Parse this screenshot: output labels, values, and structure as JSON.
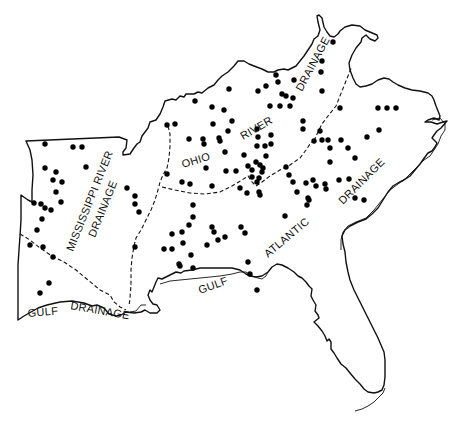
{
  "map": {
    "colors": {
      "background": "#ffffff",
      "ink": "#111111",
      "dot": "#000000"
    },
    "regions": {
      "ohio_river_drainage": {
        "labels": [
          "OHIO",
          "RIVER",
          "DRAINAGE"
        ]
      },
      "mississippi_river_drainage": {
        "labels": [
          "MISSISSIPPI RIVER",
          "DRAINAGE"
        ]
      },
      "gulf_drainage_west": {
        "labels": [
          "GULF",
          "DRAINAGE"
        ]
      },
      "gulf_atlantic": {
        "labels": [
          "GULF",
          "ATLANTIC"
        ]
      },
      "atlantic_drainage": {
        "labels": [
          "DRAINAGE"
        ]
      }
    },
    "dots": [
      [
        45,
        144
      ],
      [
        73,
        147
      ],
      [
        82,
        147
      ],
      [
        86,
        167
      ],
      [
        45,
        168
      ],
      [
        56,
        172
      ],
      [
        53,
        180
      ],
      [
        62,
        182
      ],
      [
        56,
        192
      ],
      [
        61,
        202
      ],
      [
        34,
        203
      ],
      [
        41,
        204
      ],
      [
        45,
        208
      ],
      [
        51,
        210
      ],
      [
        42,
        219
      ],
      [
        37,
        230
      ],
      [
        30,
        245
      ],
      [
        43,
        247
      ],
      [
        53,
        257
      ],
      [
        49,
        283
      ],
      [
        40,
        293
      ],
      [
        127,
        188
      ],
      [
        135,
        196
      ],
      [
        135,
        204
      ],
      [
        139,
        212
      ],
      [
        135,
        247
      ],
      [
        167,
        125
      ],
      [
        175,
        124
      ],
      [
        167,
        174
      ],
      [
        182,
        182
      ],
      [
        190,
        184
      ],
      [
        212,
        186
      ],
      [
        195,
        101
      ],
      [
        212,
        107
      ],
      [
        224,
        110
      ],
      [
        229,
        89
      ],
      [
        213,
        124
      ],
      [
        232,
        121
      ],
      [
        228,
        131
      ],
      [
        189,
        139
      ],
      [
        203,
        139
      ],
      [
        219,
        138
      ],
      [
        204,
        144
      ],
      [
        225,
        152
      ],
      [
        220,
        141
      ],
      [
        206,
        168
      ],
      [
        226,
        171
      ],
      [
        236,
        171
      ],
      [
        244,
        155
      ],
      [
        248,
        166
      ],
      [
        258,
        91
      ],
      [
        266,
        86
      ],
      [
        276,
        75
      ],
      [
        278,
        82
      ],
      [
        282,
        94
      ],
      [
        286,
        96
      ],
      [
        293,
        98
      ],
      [
        270,
        106
      ],
      [
        280,
        106
      ],
      [
        290,
        106
      ],
      [
        294,
        80
      ],
      [
        257,
        129
      ],
      [
        258,
        137
      ],
      [
        265,
        146
      ],
      [
        257,
        146
      ],
      [
        271,
        135
      ],
      [
        271,
        144
      ],
      [
        266,
        156
      ],
      [
        256,
        162
      ],
      [
        260,
        165
      ],
      [
        263,
        168
      ],
      [
        262,
        172
      ],
      [
        252,
        177
      ],
      [
        252,
        170
      ],
      [
        259,
        178
      ],
      [
        257,
        182
      ],
      [
        247,
        193
      ],
      [
        260,
        195
      ],
      [
        333,
        42
      ],
      [
        322,
        61
      ],
      [
        321,
        72
      ],
      [
        322,
        91
      ],
      [
        340,
        108
      ],
      [
        378,
        108
      ],
      [
        387,
        108
      ],
      [
        396,
        108
      ],
      [
        379,
        130
      ],
      [
        367,
        137
      ],
      [
        303,
        121
      ],
      [
        303,
        129
      ],
      [
        320,
        131
      ],
      [
        314,
        141
      ],
      [
        322,
        140
      ],
      [
        328,
        140
      ],
      [
        341,
        140
      ],
      [
        348,
        148
      ],
      [
        330,
        148
      ],
      [
        330,
        162
      ],
      [
        355,
        158
      ],
      [
        339,
        180
      ],
      [
        349,
        179
      ],
      [
        308,
        198
      ],
      [
        306,
        183
      ],
      [
        286,
        167
      ],
      [
        289,
        175
      ],
      [
        293,
        182
      ],
      [
        297,
        192
      ],
      [
        313,
        180
      ],
      [
        316,
        186
      ],
      [
        325,
        184
      ],
      [
        326,
        189
      ],
      [
        309,
        200
      ],
      [
        307,
        205
      ],
      [
        259,
        192
      ],
      [
        240,
        188
      ],
      [
        355,
        198
      ],
      [
        364,
        200
      ],
      [
        285,
        216
      ],
      [
        193,
        205
      ],
      [
        193,
        217
      ],
      [
        189,
        225
      ],
      [
        182,
        232
      ],
      [
        172,
        234
      ],
      [
        172,
        249
      ],
      [
        164,
        249
      ],
      [
        183,
        243
      ],
      [
        180,
        266
      ],
      [
        193,
        268
      ],
      [
        212,
        227
      ],
      [
        214,
        232
      ],
      [
        218,
        240
      ],
      [
        225,
        237
      ],
      [
        207,
        245
      ],
      [
        241,
        227
      ],
      [
        245,
        233
      ],
      [
        248,
        262
      ],
      [
        250,
        274
      ],
      [
        257,
        290
      ],
      [
        179,
        264
      ],
      [
        191,
        255
      ]
    ]
  }
}
